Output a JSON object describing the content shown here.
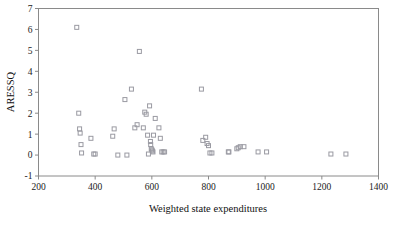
{
  "figure": {
    "kind": "scatter-plot",
    "background": "#ffffff",
    "frame_color": "#8a8a8a",
    "marker_color": "#9a9aa2",
    "marker_shape": "open-square",
    "marker_size": 4
  },
  "chart_data": {
    "type": "scatter",
    "title": "",
    "subtitle": "",
    "xlabel": "Weighted state expenditures",
    "ylabel": "ARESSQ",
    "xlim": [
      200,
      1400
    ],
    "ylim": [
      -1,
      7
    ],
    "xticks": [
      200,
      400,
      600,
      800,
      1000,
      1200,
      1400
    ],
    "xtick_labels": [
      "200",
      "400",
      "600",
      "800",
      "1000",
      "1200",
      "1400"
    ],
    "yticks": [
      -1,
      0,
      1,
      2,
      3,
      4,
      5,
      6,
      7
    ],
    "ytick_labels": [
      "-1",
      "0",
      "1",
      "2",
      "3",
      "4",
      "5",
      "6",
      "7"
    ],
    "grid": false,
    "legend": null,
    "annotations": [],
    "series": [
      {
        "name": "states",
        "n_points": 46,
        "x": [
          335,
          342,
          345,
          347,
          350,
          352,
          385,
          395,
          400,
          462,
          467,
          480,
          505,
          512,
          528,
          540,
          548,
          556,
          570,
          575,
          580,
          585,
          588,
          592,
          595,
          596,
          598,
          600,
          602,
          604,
          606,
          612,
          625,
          630,
          635,
          640,
          645,
          775,
          780,
          790,
          795,
          800,
          805,
          812,
          870,
          872,
          900,
          905,
          912,
          925,
          975,
          1005,
          1232,
          1285
        ],
        "y": [
          6.1,
          2.0,
          1.25,
          1.05,
          0.5,
          0.1,
          0.8,
          0.05,
          0.05,
          0.9,
          1.25,
          0.0,
          2.65,
          0.0,
          3.15,
          1.3,
          1.45,
          4.95,
          1.3,
          2.05,
          1.95,
          0.95,
          0.05,
          2.35,
          0.65,
          0.5,
          0.3,
          0.25,
          0.2,
          0.15,
          0.95,
          1.75,
          1.3,
          0.8,
          0.15,
          0.15,
          0.15,
          3.15,
          0.7,
          0.85,
          0.55,
          0.45,
          0.1,
          0.1,
          0.15,
          0.15,
          0.3,
          0.35,
          0.4,
          0.4,
          0.15,
          0.15,
          0.05,
          0.05
        ]
      }
    ]
  }
}
